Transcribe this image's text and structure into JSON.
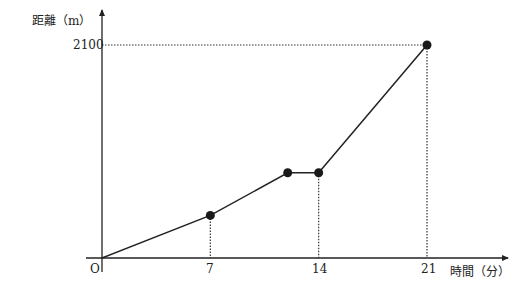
{
  "chart_data": {
    "type": "line",
    "title": "",
    "xlabel": "時間（分）",
    "ylabel": "距離（m）",
    "x_ticks": [
      7,
      14,
      21
    ],
    "y_ticks": [
      2100
    ],
    "origin_label": "O",
    "xlim": [
      0,
      22.5
    ],
    "ylim": [
      0,
      2200
    ],
    "grid": false,
    "legend": "none",
    "series": [
      {
        "name": "distance",
        "x": [
          0,
          7,
          12,
          14,
          21
        ],
        "y": [
          0,
          420,
          840,
          840,
          2100
        ],
        "markers_at": [
          7,
          12,
          14,
          21
        ]
      }
    ],
    "guides": {
      "vertical_dotted_at_x": [
        7,
        14,
        21
      ],
      "horizontal_dotted_at_y": [
        2100
      ]
    }
  },
  "labels": {
    "y_axis": "距離（m）",
    "x_axis": "時間（分）",
    "origin": "O",
    "y_tick_2100": "2100",
    "x_tick_7": "7",
    "x_tick_14": "14",
    "x_tick_21": "21"
  }
}
